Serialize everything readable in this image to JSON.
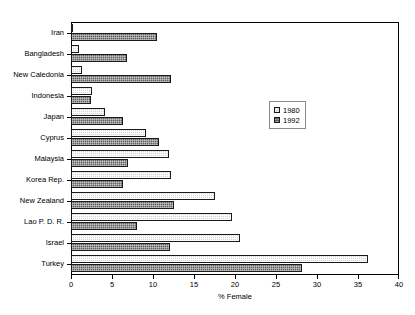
{
  "chart_data": {
    "type": "bar",
    "orientation": "horizontal",
    "title": "",
    "xlabel": "% Female",
    "ylabel": "",
    "xlim": [
      0,
      40
    ],
    "xticks": [
      0,
      5,
      10,
      15,
      20,
      25,
      30,
      35,
      40
    ],
    "grid": false,
    "legend_position": "center-right",
    "categories": [
      "Iran",
      "Bangladesh",
      "New Caledonia",
      "Indonesia",
      "Japan",
      "Cyprus",
      "Malaysia",
      "Korea Rep.",
      "New Zealand",
      "Lao P. D. R.",
      "Israel",
      "Turkey"
    ],
    "series": [
      {
        "name": "1980",
        "color": "#d6d6d6",
        "values": [
          0.2,
          1.0,
          1.4,
          2.5,
          4.2,
          9.2,
          12.0,
          12.2,
          17.6,
          19.6,
          20.6,
          36.2
        ]
      },
      {
        "name": "1992",
        "color": "#5f5f5f",
        "values": [
          10.5,
          6.8,
          12.2,
          2.4,
          6.3,
          10.7,
          7.0,
          6.4,
          12.5,
          8.0,
          12.1,
          28.2
        ]
      }
    ]
  },
  "axis": {
    "x_title": "% Female",
    "tick_labels": [
      "0",
      "5",
      "10",
      "15",
      "20",
      "25",
      "30",
      "35",
      "40"
    ]
  },
  "legend": {
    "entries": [
      {
        "label": "1980"
      },
      {
        "label": "1992"
      }
    ]
  }
}
